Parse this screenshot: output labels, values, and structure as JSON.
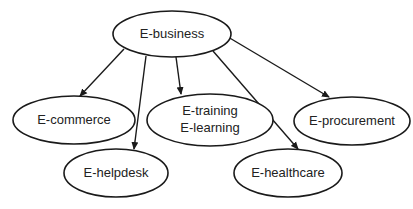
{
  "diagram": {
    "type": "tree",
    "colors": {
      "stroke": "#1a1a1a",
      "fill": "#ffffff",
      "text": "#222222"
    },
    "root": {
      "id": "ebusiness",
      "label": "E-business"
    },
    "nodes": [
      {
        "id": "ebusiness",
        "label": "E-business",
        "line1": "E-business"
      },
      {
        "id": "ecommerce",
        "label": "E-commerce",
        "line1": "E-commerce"
      },
      {
        "id": "etraining",
        "label": "E-training E-learning",
        "line1": "E-training",
        "line2": "E-learning"
      },
      {
        "id": "eprocurement",
        "label": "E-procurement",
        "line1": "E-procurement"
      },
      {
        "id": "ehelpdesk",
        "label": "E-helpdesk",
        "line1": "E-helpdesk"
      },
      {
        "id": "ehealthcare",
        "label": "E-healthcare",
        "line1": "E-healthcare"
      }
    ],
    "edges": [
      {
        "from": "ebusiness",
        "to": "ecommerce"
      },
      {
        "from": "ebusiness",
        "to": "ehelpdesk"
      },
      {
        "from": "ebusiness",
        "to": "etraining"
      },
      {
        "from": "ebusiness",
        "to": "ehealthcare"
      },
      {
        "from": "ebusiness",
        "to": "eprocurement"
      }
    ]
  }
}
